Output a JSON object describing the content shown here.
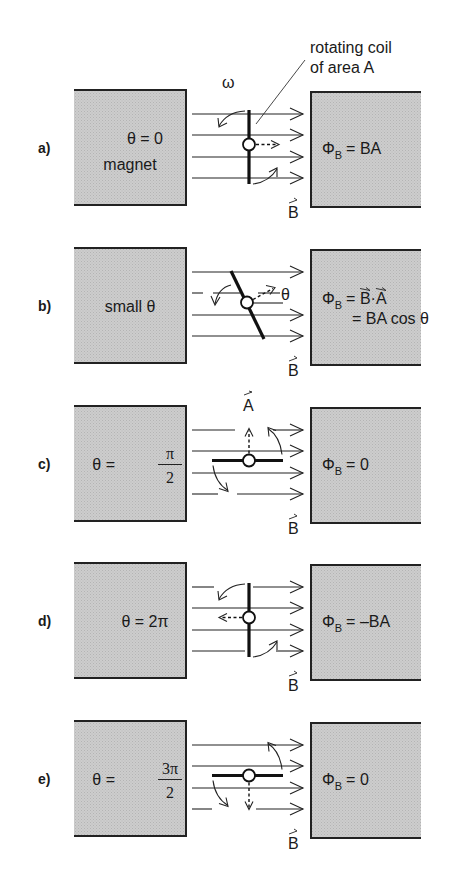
{
  "page": {
    "cut_off_header_text": "... phenomenon of magnetic induction ... (a plane ..."
  },
  "callout": {
    "line1": "rotating coil",
    "line2": "of area A"
  },
  "colors": {
    "magnet_fill": "#c9c9c9",
    "magnet_edge": "#222222",
    "ink": "#1a1a1a",
    "background": "#ffffff"
  },
  "symbols": {
    "omega": "ω",
    "field_vector": "B",
    "area_vector": "A",
    "theta": "θ"
  },
  "panels": [
    {
      "label": "a)",
      "angle_text": "θ = 0",
      "magnet_text": "magnet",
      "flux_lhs": "Φ",
      "flux_sub": "B",
      "flux_rhs": "= BA",
      "flux_rhs2": "",
      "coil_orientation": "vertical",
      "normal_direction": "right",
      "theta_rad": 0
    },
    {
      "label": "b)",
      "angle_text": "small θ",
      "magnet_text": "",
      "flux_lhs": "Φ",
      "flux_sub": "B",
      "flux_rhs": "= B·A",
      "flux_rhs2": "= BA cos θ",
      "coil_orientation": "tilted",
      "normal_direction": "up-right",
      "theta_label": "θ",
      "theta_rad": "small"
    },
    {
      "label": "c)",
      "angle_text": "θ =",
      "angle_frac_num": "π",
      "angle_frac_den": "2",
      "flux_lhs": "Φ",
      "flux_sub": "B",
      "flux_rhs": "= 0",
      "flux_rhs2": "",
      "coil_orientation": "horizontal",
      "normal_direction": "up",
      "theta_rad": "π/2"
    },
    {
      "label": "d)",
      "angle_text": "θ = 2π",
      "flux_lhs": "Φ",
      "flux_sub": "B",
      "flux_rhs": "= –BA",
      "flux_rhs2": "",
      "coil_orientation": "vertical",
      "normal_direction": "left",
      "theta_rad": "2π"
    },
    {
      "label": "e)",
      "angle_text": "θ =",
      "angle_frac_num": "3π",
      "angle_frac_den": "2",
      "flux_lhs": "Φ",
      "flux_sub": "B",
      "flux_rhs": "= 0",
      "flux_rhs2": "",
      "coil_orientation": "horizontal",
      "normal_direction": "down",
      "theta_rad": "3π/2"
    }
  ]
}
